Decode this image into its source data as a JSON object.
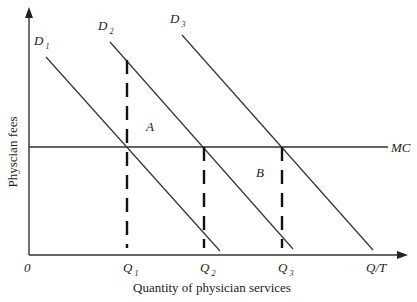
{
  "diagram": {
    "type": "supply-demand",
    "y_axis_label": "Physcian fees",
    "x_axis_label": "Quantity of physician services",
    "origin_label": "0",
    "x_axis_end_label": "Q/T",
    "mc_label": "MC",
    "curves": [
      {
        "name": "D",
        "sub": "1",
        "x1": 46,
        "y1": 57,
        "x2": 220,
        "y2": 251
      },
      {
        "name": "D",
        "sub": "2",
        "x1": 110,
        "y1": 42,
        "x2": 293,
        "y2": 249
      },
      {
        "name": "D",
        "sub": "3",
        "x1": 182,
        "y1": 35,
        "x2": 373,
        "y2": 250
      }
    ],
    "quantities": [
      {
        "name": "Q",
        "sub": "1",
        "x": 127,
        "y_top": 60
      },
      {
        "name": "Q",
        "sub": "2",
        "x": 204,
        "y_top": 147
      },
      {
        "name": "Q",
        "sub": "3",
        "x": 282,
        "y_top": 147
      }
    ],
    "region_labels": [
      {
        "label": "A",
        "x": 146,
        "y": 131
      },
      {
        "label": "B",
        "x": 256,
        "y": 177
      }
    ],
    "colors": {
      "line": "#333333",
      "dash": "#111111",
      "text": "#222222",
      "background": "#ffffff"
    }
  }
}
